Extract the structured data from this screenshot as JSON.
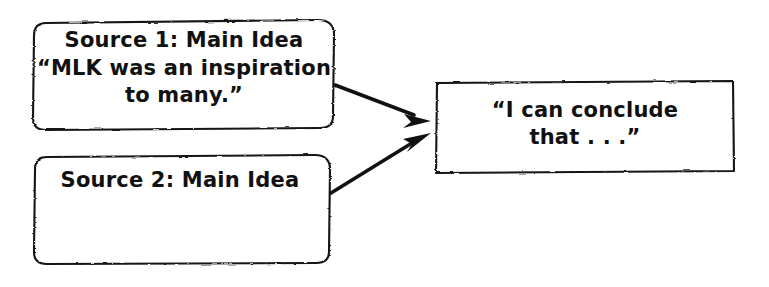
{
  "canvas": {
    "width": 769,
    "height": 287,
    "background": "#ffffff",
    "ink_color": "#111111",
    "style": "hand-drawn sketch"
  },
  "diagram": {
    "type": "synthesis-graphic-organizer",
    "nodes": [
      {
        "id": "source-1",
        "shape": "rounded-rectangle",
        "lines": [
          "Source 1: Main Idea",
          "“MLK was an inspiration",
          "to many.”"
        ]
      },
      {
        "id": "source-2",
        "shape": "rounded-rectangle",
        "lines": [
          "Source 2: Main Idea"
        ]
      },
      {
        "id": "conclusion",
        "shape": "rectangle",
        "lines": [
          "“I can conclude",
          "that . . .”"
        ]
      }
    ],
    "arrows": [
      {
        "id": "arrow-source1-to-conclusion",
        "from": "source-1",
        "to": "conclusion"
      },
      {
        "id": "arrow-source2-to-conclusion",
        "from": "source-2",
        "to": "conclusion"
      }
    ]
  }
}
